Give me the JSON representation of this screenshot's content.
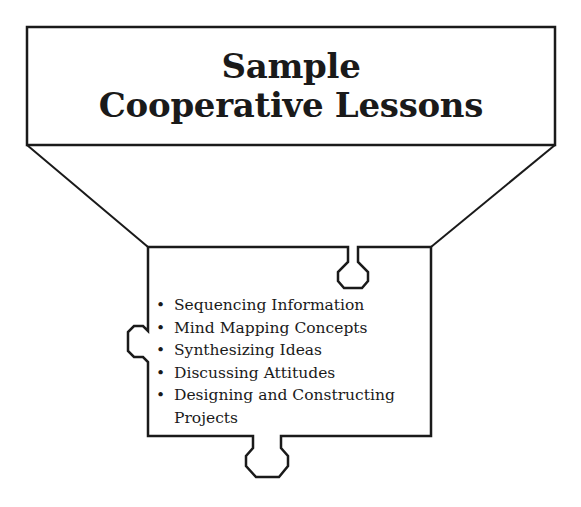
{
  "title": {
    "line1": "Sample",
    "line2": "Cooperative Lessons"
  },
  "lessons": {
    "bullet": "•",
    "items": [
      "Sequencing Information",
      "Mind Mapping Concepts",
      "Synthesizing Ideas",
      "Discussing Attitudes",
      "Designing and Constructing Projects"
    ]
  },
  "colors": {
    "stroke": "#1a1a1a",
    "background": "#ffffff"
  }
}
